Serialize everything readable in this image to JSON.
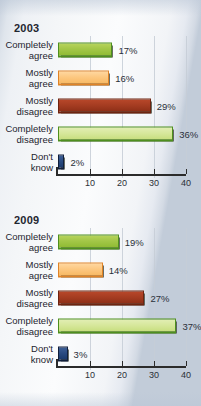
{
  "chart_data": [
    {
      "type": "bar",
      "orientation": "horizontal",
      "title": "2003",
      "xlabel": "",
      "ylabel": "",
      "xlim": [
        0,
        40
      ],
      "xticks": [
        10,
        20,
        30,
        40
      ],
      "xtick_labels": [
        "10",
        "20",
        "30",
        "40"
      ],
      "grid": true,
      "legend": "none",
      "categories": [
        "Completely agree",
        "Mostly agree",
        "Mostly disagree",
        "Completely disagree",
        "Don't know"
      ],
      "values": [
        17,
        16,
        29,
        36,
        2
      ],
      "value_labels": [
        "17%",
        "16%",
        "29%",
        "36%",
        "2%"
      ],
      "bar_colors": [
        "#a3c748",
        "#fcc77f",
        "#a63d22",
        "#d6e79a",
        "#294a80"
      ]
    },
    {
      "type": "bar",
      "orientation": "horizontal",
      "title": "2009",
      "xlabel": "",
      "ylabel": "",
      "xlim": [
        0,
        40
      ],
      "xticks": [
        10,
        20,
        30,
        40
      ],
      "xtick_labels": [
        "10",
        "20",
        "30",
        "40"
      ],
      "grid": true,
      "legend": "none",
      "categories": [
        "Completely agree",
        "Mostly agree",
        "Mostly disagree",
        "Completely disagree",
        "Don't know"
      ],
      "values": [
        19,
        14,
        27,
        37,
        3
      ],
      "value_labels": [
        "19%",
        "14%",
        "27%",
        "37%",
        "3%"
      ],
      "bar_colors": [
        "#a3c748",
        "#fcc77f",
        "#a63d22",
        "#d6e79a",
        "#294a80"
      ]
    }
  ],
  "charts": [
    {
      "year": "2003",
      "rows": [
        {
          "line1": "Completely",
          "line2": "agree",
          "value": 17,
          "label": "17%",
          "color_name": "green"
        },
        {
          "line1": "Mostly",
          "line2": "agree",
          "value": 16,
          "label": "16%",
          "color_name": "orange"
        },
        {
          "line1": "Mostly",
          "line2": "disagree",
          "value": 29,
          "label": "29%",
          "color_name": "red"
        },
        {
          "line1": "Completely",
          "line2": "disagree",
          "value": 36,
          "label": "36%",
          "color_name": "palegreen"
        },
        {
          "line1": "Don't",
          "line2": "know",
          "value": 2,
          "label": "2%",
          "color_name": "blue"
        }
      ],
      "axis": {
        "ticks": [
          "10",
          "20",
          "30",
          "40"
        ]
      }
    },
    {
      "year": "2009",
      "rows": [
        {
          "line1": "Completely",
          "line2": "agree",
          "value": 19,
          "label": "19%",
          "color_name": "green"
        },
        {
          "line1": "Mostly",
          "line2": "agree",
          "value": 14,
          "label": "14%",
          "color_name": "orange"
        },
        {
          "line1": "Mostly",
          "line2": "disagree",
          "value": 27,
          "label": "27%",
          "color_name": "red"
        },
        {
          "line1": "Completely",
          "line2": "disagree",
          "value": 37,
          "label": "37%",
          "color_name": "palegreen"
        },
        {
          "line1": "Don't",
          "line2": "know",
          "value": 3,
          "label": "3%",
          "color_name": "blue"
        }
      ],
      "axis": {
        "ticks": [
          "10",
          "20",
          "30",
          "40"
        ]
      }
    }
  ]
}
